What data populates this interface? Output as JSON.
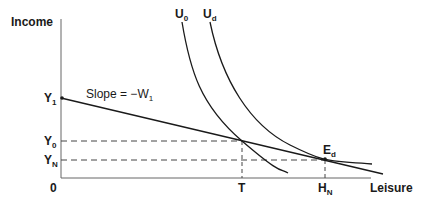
{
  "diagram": {
    "axes": {
      "y_label": "Income",
      "x_label": "Leisure",
      "origin_label": "0"
    },
    "y_ticks": [
      {
        "main": "Y",
        "sub": "1"
      },
      {
        "main": "Y",
        "sub": "0"
      },
      {
        "main": "Y",
        "sub": "N"
      }
    ],
    "x_ticks": [
      {
        "main": "T",
        "sub": ""
      },
      {
        "main": "H",
        "sub": "N"
      }
    ],
    "curves": [
      {
        "main": "U",
        "sub": "0"
      },
      {
        "main": "U",
        "sub": "d"
      }
    ],
    "point": {
      "main": "E",
      "sub": "d"
    },
    "budget_line_label": {
      "text": "Slope = −W",
      "sub": "1"
    },
    "colors": {
      "line": "#1a1a1a",
      "axis": "#555555",
      "dash": "#444444"
    }
  }
}
